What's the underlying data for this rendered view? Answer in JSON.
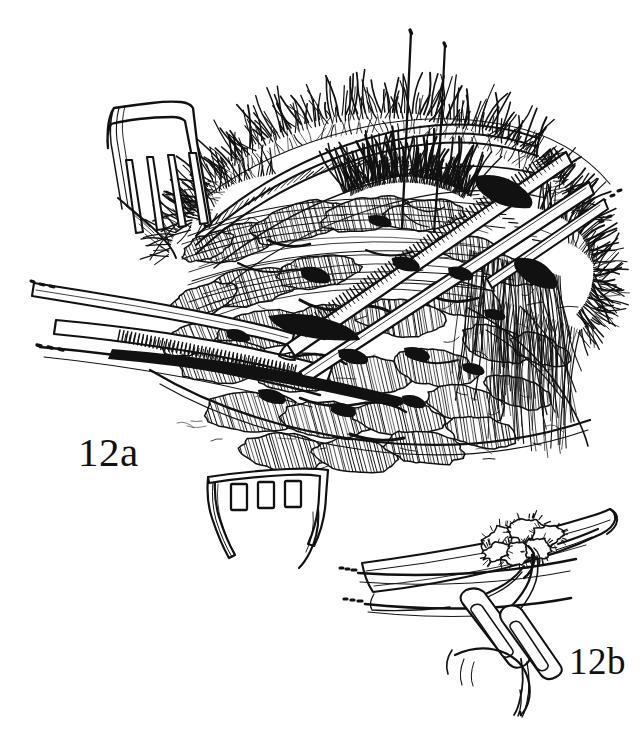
{
  "figure": {
    "kind": "pen-and-ink surgical illustration",
    "background_color": "#ffffff",
    "ink_color": "#111111",
    "panels": [
      {
        "id": "12a",
        "label": "12a",
        "label_x": 78,
        "label_y": 432,
        "caption_role": "main operative field",
        "elements": [
          {
            "name": "upper-rake-retractor",
            "prongs": 4,
            "position": "upper-left"
          },
          {
            "name": "lower-rake-retractor",
            "prongs": 3,
            "position": "bottom-center"
          },
          {
            "name": "serrated-forceps-left",
            "position": "mid-left"
          },
          {
            "name": "serrated-forceps-diagonal",
            "position": "center-right"
          },
          {
            "name": "eyelashes",
            "position": "upper-arc"
          },
          {
            "name": "traction-sutures",
            "count": 2,
            "position": "top-center"
          },
          {
            "name": "orbital-fat-lobules",
            "position": "center"
          },
          {
            "name": "lateral-canthus-tissue",
            "position": "right"
          }
        ]
      },
      {
        "id": "12b",
        "label": "12b",
        "label_x": 569,
        "label_y": 643,
        "caption_role": "inset detail of ligature",
        "elements": [
          {
            "name": "vessel-stump",
            "position": "center"
          },
          {
            "name": "suture-knot",
            "position": "center"
          },
          {
            "name": "hemostat-jaws",
            "count": 2,
            "position": "lower-center"
          },
          {
            "name": "suture-tails",
            "count": 2,
            "position": "lower-center"
          }
        ]
      }
    ]
  },
  "labels": {
    "panel_a": "12a",
    "panel_b": "12b"
  },
  "colors": {
    "ink": "#111111",
    "paper": "#ffffff"
  }
}
